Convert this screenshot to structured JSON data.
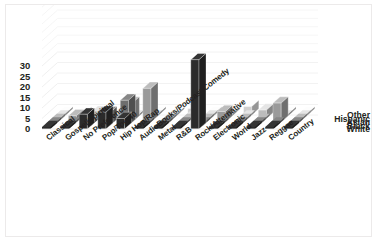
{
  "chart": {
    "type": "bar",
    "title": "",
    "xlabel": "",
    "ylabel": "",
    "background": "#ffffff",
    "border_color": "#eceaea"
  },
  "yaxis": {
    "ticks": [
      "30",
      "25",
      "20",
      "15",
      "10",
      "5",
      "0"
    ],
    "min": 0,
    "max": 30,
    "step": 5
  },
  "rows": {
    "labels": [
      "Other",
      "Hispanic",
      "Asian",
      "Black",
      "White"
    ],
    "colors": [
      "#cfcfcf",
      "#bcbcbc",
      "#9a9a9a",
      "#6e6e6e",
      "#2b2b2b"
    ]
  },
  "categories": [
    "Classical",
    "Gospel/Spiritual",
    "No Preference",
    "Pop/Top 40",
    "Hip Hop/Rap",
    "AudioBooks/Podcast/Comedy",
    "Metal",
    "R&B",
    "Rock/Alternative",
    "Electronic",
    "World",
    "Jazz",
    "Reggae",
    "Country"
  ],
  "chart_data": {
    "type": "bar",
    "title": "",
    "xlabel": "",
    "ylabel": "",
    "ylim": [
      0,
      30
    ],
    "yticks": [
      0,
      5,
      10,
      15,
      20,
      25,
      30
    ],
    "grid": true,
    "legend": "right",
    "categories": [
      "Classical",
      "Gospel/Spiritual",
      "No Preference",
      "Pop/Top 40",
      "Hip Hop/Rap",
      "AudioBooks/Podcast/Comedy",
      "Metal",
      "R&B",
      "Rock/Alternative",
      "Electronic",
      "World",
      "Jazz",
      "Reggae",
      "Country"
    ],
    "series": [
      {
        "name": "White",
        "values": [
          0,
          0,
          7,
          8,
          5,
          0,
          0,
          0,
          33,
          0,
          0,
          0,
          0,
          0
        ]
      },
      {
        "name": "Black",
        "values": [
          0,
          0,
          0,
          6,
          12,
          0,
          0,
          0,
          0,
          0,
          0,
          0,
          0,
          0
        ]
      },
      {
        "name": "Asian",
        "values": [
          0,
          3,
          0,
          0,
          9,
          16,
          0,
          0,
          0,
          5,
          0,
          0,
          9,
          0
        ]
      },
      {
        "name": "Hispanic",
        "values": [
          0,
          0,
          3,
          0,
          0,
          0,
          0,
          0,
          0,
          0,
          0,
          4,
          0,
          0
        ]
      },
      {
        "name": "Other",
        "values": [
          0,
          0,
          0,
          0,
          0,
          0,
          0,
          3,
          0,
          0,
          4,
          0,
          0,
          0
        ]
      }
    ]
  }
}
